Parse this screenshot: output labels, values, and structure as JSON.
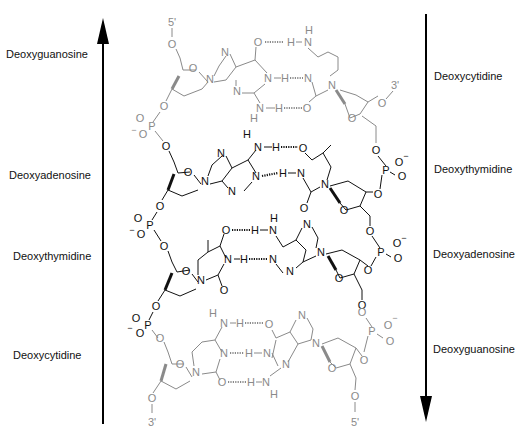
{
  "left_strand": {
    "direction": "5' to 3' (arrow pointing up)",
    "end_top": "5'",
    "end_bottom": "3'",
    "labels": [
      "Deoxyguanosine",
      "Deoxyadenosine",
      "Deoxythymidine",
      "Deoxycytidine"
    ]
  },
  "right_strand": {
    "direction": "arrow pointing down",
    "end_top": "3'",
    "end_bottom": "5'",
    "labels": [
      "Deoxycytidine",
      "Deoxythymidine",
      "Deoxyadenosine",
      "Deoxyguanosine"
    ]
  },
  "base_pairs": [
    {
      "left": "G",
      "right": "C",
      "hydrogen_bonds": 3,
      "color": "#8a8a8a"
    },
    {
      "left": "A",
      "right": "T",
      "hydrogen_bonds": 2,
      "color": "#111111"
    },
    {
      "left": "T",
      "right": "A",
      "hydrogen_bonds": 2,
      "color": "#111111"
    },
    {
      "left": "C",
      "right": "G",
      "hydrogen_bonds": 3,
      "color": "#8a8a8a"
    }
  ],
  "atoms": {
    "O": "O",
    "N": "N",
    "H": "H",
    "P": "P",
    "neg": "−"
  },
  "colors": {
    "gc_pair": "#8a8a8a",
    "at_pair": "#111111",
    "arrow": "#000000"
  }
}
